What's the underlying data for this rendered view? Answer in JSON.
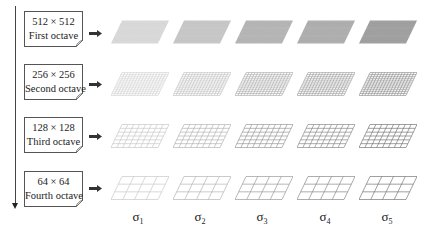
{
  "diagram": {
    "octaves": [
      {
        "resolution": "512 × 512",
        "label": "First octave",
        "grid_cols": 32,
        "grid_rows": 20
      },
      {
        "resolution": "256 × 256",
        "label": "Second octave",
        "grid_cols": 16,
        "grid_rows": 12
      },
      {
        "resolution": "128 × 128",
        "label": "Third octave",
        "grid_cols": 8,
        "grid_rows": 6
      },
      {
        "resolution": "64 × 64",
        "label": "Fourth octave",
        "grid_cols": 4,
        "grid_rows": 3
      }
    ],
    "scales": [
      {
        "symbol": "σ",
        "subscript": "1"
      },
      {
        "symbol": "σ",
        "subscript": "2"
      },
      {
        "symbol": "σ",
        "subscript": "3"
      },
      {
        "symbol": "σ",
        "subscript": "4"
      },
      {
        "symbol": "σ",
        "subscript": "5"
      }
    ],
    "scale_line_colors": [
      "#c8c8c8",
      "#b4b4b4",
      "#9a9a9a",
      "#8a8a8a",
      "#777777"
    ],
    "scale_fill_colors_first_octave": [
      "#d2d2d2",
      "#bdbdbd",
      "#a8a8a8",
      "#a0a0a0",
      "#8f8f8f"
    ],
    "arrow_icon": "right-arrow-icon",
    "axis_icon": "down-arrow-icon"
  }
}
